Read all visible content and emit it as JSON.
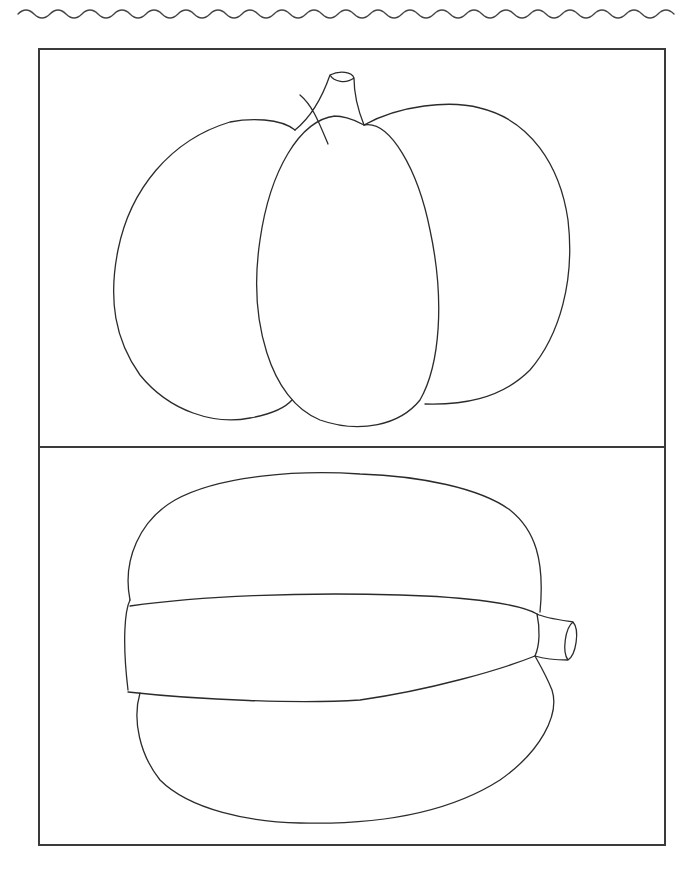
{
  "page": {
    "type": "coloring-page",
    "decoration": "wavy-line-top",
    "line_color": "#2b2b2b",
    "background_color": "#ffffff"
  },
  "panels": [
    {
      "id": "top",
      "subject": "pumpkin-front-view"
    },
    {
      "id": "bottom",
      "subject": "pumpkin-side-view"
    }
  ]
}
